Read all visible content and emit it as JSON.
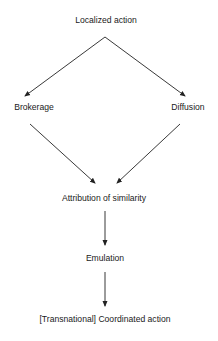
{
  "diagram": {
    "type": "flowchart",
    "nodes": [
      {
        "id": "localized",
        "label": "Localized action"
      },
      {
        "id": "brokerage",
        "label": "Brokerage"
      },
      {
        "id": "diffusion",
        "label": "Diffusion"
      },
      {
        "id": "attribution",
        "label": "Attribution of similarity"
      },
      {
        "id": "emulation",
        "label": "Emulation"
      },
      {
        "id": "coordinated",
        "label": "[Transnational] Coordinated action"
      }
    ],
    "edges": [
      {
        "from": "localized",
        "to": "brokerage"
      },
      {
        "from": "localized",
        "to": "diffusion"
      },
      {
        "from": "brokerage",
        "to": "attribution"
      },
      {
        "from": "diffusion",
        "to": "attribution"
      },
      {
        "from": "attribution",
        "to": "emulation"
      },
      {
        "from": "emulation",
        "to": "coordinated"
      }
    ],
    "colors": {
      "line": "#222222",
      "text": "#1a1a1a",
      "background": "#ffffff"
    }
  }
}
